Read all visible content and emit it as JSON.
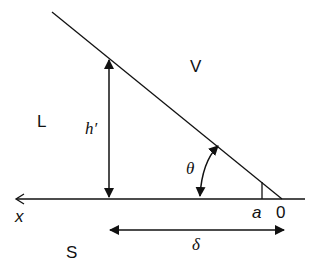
{
  "diagram": {
    "labels": {
      "region_vapor": "V",
      "region_liquid": "L",
      "region_solid": "S",
      "height": "h′",
      "angle": "θ",
      "point_a": "a",
      "origin": "0",
      "axis_x": "x",
      "distance": "δ"
    },
    "colors": {
      "stroke": "#111111",
      "background": "#ffffff"
    }
  }
}
